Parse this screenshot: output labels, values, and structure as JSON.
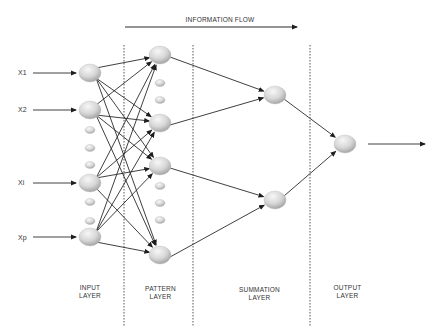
{
  "diagram": {
    "type": "probabilistic-neural-network",
    "title": "INFORMATION FLOW",
    "colors": {
      "line": "#2a2a2a",
      "node_light": "#f2f2f2",
      "node_dark": "#a9a9a9",
      "divider": "#555555"
    },
    "inputs": [
      {
        "label": "X1",
        "y": 73
      },
      {
        "label": "X2",
        "y": 110
      },
      {
        "label": "Xi",
        "y": 183
      },
      {
        "label": "Xp",
        "y": 237
      }
    ],
    "input_small_dots_y": [
      130,
      148,
      165,
      202,
      221
    ],
    "pattern_nodes_y": [
      55,
      123,
      166,
      255
    ],
    "pattern_small_dots_y": [
      83,
      100,
      186,
      203,
      220
    ],
    "summation_nodes": [
      {
        "x": 275,
        "y": 95
      },
      {
        "x": 275,
        "y": 200
      }
    ],
    "output_node": {
      "x": 345,
      "y": 144
    },
    "edges": {
      "input_to_pattern": "fully-connected",
      "pattern_to_summation": [
        [
          0,
          0
        ],
        [
          1,
          0
        ],
        [
          2,
          1
        ],
        [
          3,
          1
        ]
      ],
      "summation_to_output": [
        [
          0,
          0
        ],
        [
          1,
          0
        ]
      ]
    },
    "layers": [
      {
        "line1": "INPUT",
        "line2": "LAYER"
      },
      {
        "line1": "PATTERN",
        "line2": "LAYER"
      },
      {
        "line1": "SUMMATION",
        "line2": "LAYER"
      },
      {
        "line1": "OUTPUT",
        "line2": "LAYER"
      }
    ]
  }
}
